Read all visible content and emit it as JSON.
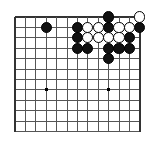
{
  "figure": {
    "kind": "go-board-diagram"
  },
  "board": {
    "columns": 13,
    "rows": 12,
    "origin_x": 15,
    "origin_y": 17,
    "spacing": 10.4,
    "line_color": "#555555",
    "edge_color": "#333333",
    "background_color": "#ffffff",
    "line_width": 1,
    "edge_line_width": 1.6,
    "stone_radius": 5.6,
    "hoshi_size": 3,
    "hoshi_points": [
      {
        "col": 3,
        "row": 7
      },
      {
        "col": 9,
        "row": 7
      }
    ]
  },
  "colors": {
    "black_stone": "#111111",
    "white_stone": "#ffffff",
    "stone_outline": "#000000",
    "grid": "#555555"
  },
  "stones": [
    {
      "col": 9,
      "row": 0,
      "color": "black"
    },
    {
      "col": 12,
      "row": 0,
      "color": "white"
    },
    {
      "col": 3,
      "row": 1,
      "color": "black"
    },
    {
      "col": 6,
      "row": 1,
      "color": "black"
    },
    {
      "col": 7,
      "row": 1,
      "color": "white"
    },
    {
      "col": 8,
      "row": 1,
      "color": "white"
    },
    {
      "col": 9,
      "row": 1,
      "color": "black"
    },
    {
      "col": 10,
      "row": 1,
      "color": "white"
    },
    {
      "col": 11,
      "row": 1,
      "color": "white"
    },
    {
      "col": 12,
      "row": 1,
      "color": "black"
    },
    {
      "col": 6,
      "row": 2,
      "color": "black"
    },
    {
      "col": 7,
      "row": 2,
      "color": "white"
    },
    {
      "col": 8,
      "row": 2,
      "color": "white"
    },
    {
      "col": 9,
      "row": 2,
      "color": "white"
    },
    {
      "col": 10,
      "row": 2,
      "color": "white"
    },
    {
      "col": 11,
      "row": 2,
      "color": "black"
    },
    {
      "col": 6,
      "row": 3,
      "color": "black"
    },
    {
      "col": 7,
      "row": 3,
      "color": "black"
    },
    {
      "col": 9,
      "row": 3,
      "color": "black"
    },
    {
      "col": 10,
      "row": 3,
      "color": "black"
    },
    {
      "col": 11,
      "row": 3,
      "color": "black"
    },
    {
      "col": 9,
      "row": 4,
      "color": "black"
    }
  ],
  "counts": {
    "black_stones": 13,
    "white_stones": 9,
    "total_stones": 22
  }
}
